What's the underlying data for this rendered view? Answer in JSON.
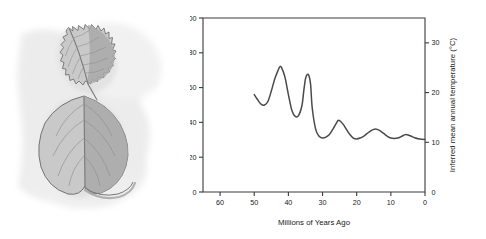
{
  "figure": {
    "illustration": {
      "name": "leaf-margin-illustration",
      "toothed_leaf_label": "toothed-margin-leaf",
      "entire_leaf_label": "entire-margined-leaf",
      "colors": {
        "wash": "#e8e8e8",
        "leaf_light": "#cfcfcf",
        "leaf_dark": "#ababab",
        "vein": "#8e8e8e",
        "outline": "#6f6f6f"
      }
    }
  },
  "chart_data": {
    "type": "line",
    "title": "",
    "xlabel": "Millions of Years Ago",
    "ylabel": "Percent of entire-margined species",
    "y2label": "Inferred mean annual temperature (°C)",
    "xlim": [
      65,
      0
    ],
    "ylim": [
      0,
      100
    ],
    "y2lim": [
      0,
      35
    ],
    "x_reversed": true,
    "grid": false,
    "legend": null,
    "xticks": [
      60,
      50,
      40,
      30,
      20,
      10,
      0
    ],
    "xticklabels": [
      "60",
      "50",
      "40",
      "30",
      "20",
      "10",
      "0"
    ],
    "yticks": [
      0,
      20,
      40,
      60,
      80,
      100
    ],
    "yticklabels": [
      "0",
      "20",
      "40",
      "60",
      "80",
      "100"
    ],
    "y2ticks": [
      0,
      10,
      20,
      30
    ],
    "y2ticklabels": [
      "0",
      "10",
      "20",
      "30"
    ],
    "series": [
      {
        "name": "Percent entire-margined species",
        "color": "#4a4a4a",
        "x": [
          50.0,
          49.0,
          48.0,
          47.0,
          46.0,
          45.0,
          44.0,
          43.0,
          42.5,
          42.0,
          41.0,
          40.0,
          39.0,
          38.0,
          37.0,
          36.0,
          35.5,
          35.0,
          34.5,
          34.0,
          33.5,
          33.0,
          32.0,
          31.0,
          30.0,
          29.0,
          28.0,
          27.0,
          26.0,
          25.5,
          25.0,
          24.0,
          23.0,
          22.0,
          21.0,
          20.0,
          19.0,
          18.0,
          17.0,
          16.0,
          15.0,
          14.5,
          14.0,
          13.0,
          12.0,
          11.0,
          10.0,
          9.0,
          8.0,
          7.0,
          6.0,
          5.5,
          5.0,
          4.0,
          3.0,
          2.0,
          1.0,
          0.0
        ],
        "y": [
          56.0,
          53.0,
          50.5,
          50.0,
          52.0,
          58.0,
          65.0,
          70.0,
          72.0,
          71.5,
          66.0,
          56.0,
          47.0,
          43.5,
          44.0,
          50.0,
          58.0,
          65.0,
          67.5,
          67.0,
          62.0,
          48.0,
          36.0,
          32.0,
          31.0,
          31.5,
          33.0,
          36.0,
          39.5,
          41.0,
          41.0,
          39.0,
          36.0,
          33.0,
          31.0,
          30.5,
          31.0,
          32.0,
          33.5,
          35.0,
          36.0,
          36.2,
          36.0,
          35.0,
          33.5,
          32.0,
          31.0,
          30.8,
          31.0,
          31.8,
          32.8,
          33.0,
          32.8,
          32.0,
          31.2,
          30.6,
          30.3,
          30.2
        ]
      }
    ],
    "annotations": []
  }
}
